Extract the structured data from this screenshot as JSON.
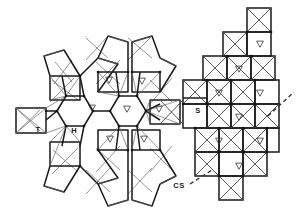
{
  "figure": {
    "type": "crystal-structure-polyhedral-diagram",
    "background_color": "#ffffff",
    "line_color": "#1a1a1a",
    "thin_line_color": "#555555",
    "vertex_color": "#111111"
  },
  "labels": [
    {
      "id": "hexagonal-tunnel",
      "text": "H",
      "x": 74,
      "y": 131
    },
    {
      "id": "triangular-tunnel",
      "text": "T",
      "x": 38,
      "y": 130
    },
    {
      "id": "square-tunnel",
      "text": "S",
      "x": 198,
      "y": 111
    },
    {
      "id": "shear-plane",
      "text": "CS",
      "x": 179,
      "y": 186
    }
  ],
  "leaders": [
    {
      "id": "cs-leader",
      "x1": 190,
      "y1": 184,
      "x2": 212,
      "y2": 170
    },
    {
      "id": "shear-plane-trace",
      "x1": 268,
      "y1": 116,
      "x2": 294,
      "y2": 92
    }
  ],
  "site_markers": {
    "glyph": "triangle-down",
    "note": "small open down-pointing triangles marking occupied interstitial sites",
    "positions": [
      {
        "x": 109,
        "y": 80
      },
      {
        "x": 142,
        "y": 81
      },
      {
        "x": 92,
        "y": 108
      },
      {
        "x": 127,
        "y": 109
      },
      {
        "x": 159,
        "y": 109
      },
      {
        "x": 110,
        "y": 139
      },
      {
        "x": 144,
        "y": 139
      },
      {
        "x": 260,
        "y": 44
      },
      {
        "x": 239,
        "y": 69
      },
      {
        "x": 219,
        "y": 93
      },
      {
        "x": 260,
        "y": 93
      },
      {
        "x": 239,
        "y": 117
      },
      {
        "x": 219,
        "y": 141
      },
      {
        "x": 260,
        "y": 141
      },
      {
        "x": 239,
        "y": 166
      }
    ]
  },
  "chart_data": {
    "type": "diagram",
    "title": "",
    "regions": [
      {
        "name": "H",
        "meaning": "hexagonal tunnel",
        "count": 2
      },
      {
        "name": "T",
        "meaning": "triangular tunnel",
        "count": 1
      },
      {
        "name": "S",
        "meaning": "square tunnel",
        "count": 1
      },
      {
        "name": "CS",
        "meaning": "crystallographic shear plane",
        "count": 1
      }
    ],
    "octahedra_count": 26,
    "marked_sites": 15
  }
}
